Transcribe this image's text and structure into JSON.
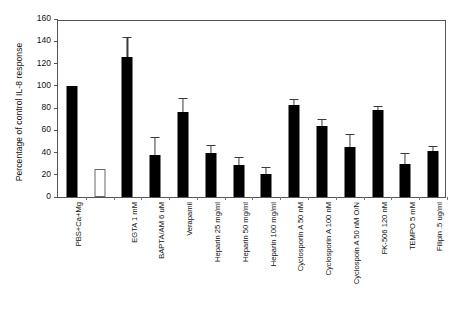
{
  "chart_data": {
    "type": "bar",
    "title": "",
    "subtitle": "",
    "xlabel": "",
    "ylabel": "Percentage of control IL-8 response",
    "ylim": [
      0,
      160
    ],
    "ytick_step": 20,
    "yticks": [
      0,
      20,
      40,
      60,
      80,
      100,
      120,
      140,
      160
    ],
    "grid": false,
    "legend": "none",
    "bar_color": "#000000",
    "open_bar_color": "#ffffff",
    "categories": [
      "PBS+Ca+Mg",
      "EGTA 1 mM",
      "BAPTA/AM 6 uM",
      "Verapamil",
      "Heparin 25 mg/ml",
      "Heparin 50 mg/ml",
      "Heparin 100 mg/ml",
      "Cyclosporin A 50 nM",
      "Cyclosporin A 100 nM",
      "Cyclospoin A 50 nM O/N",
      "FK-506  120 nM",
      "TEMPO 5 mM",
      "Filipin .5 ug/ml"
    ],
    "values": [
      100,
      126,
      38,
      76,
      40,
      29,
      21,
      83,
      64,
      45,
      78,
      30,
      41
    ],
    "errors": [
      0,
      17,
      15,
      12,
      6,
      6,
      5,
      4,
      5,
      11,
      3,
      9,
      4
    ],
    "extra_bars": [
      {
        "after_category": "PBS+Ca+Mg",
        "value": 25,
        "error": 0,
        "style": "open",
        "label": ""
      }
    ]
  }
}
